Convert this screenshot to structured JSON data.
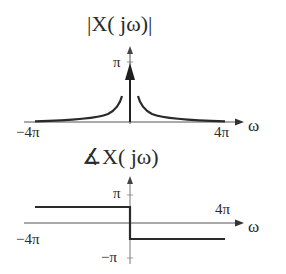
{
  "magnitude_plot": {
    "title": "|X( jω)|",
    "y_tick": "π",
    "x_tick_left": "−4π",
    "x_tick_right": "4π",
    "x_axis_label": "ω",
    "impulse_height_label": "π",
    "description": "Impulse of height π at ω=0 plus symmetric decaying curve from −4π to 4π"
  },
  "phase_plot": {
    "title": "∡X( jω)",
    "y_tick_top": "π",
    "y_tick_bottom": "−π",
    "x_tick_left": "−4π",
    "x_tick_right": "4π",
    "x_axis_label": "ω",
    "description": "Phase +π/2 for ω<0, −π/2 for ω>0 over −4π..4π"
  },
  "colors": {
    "line": "#2a2a2a",
    "axis": "#555555",
    "background": "#ffffff"
  }
}
